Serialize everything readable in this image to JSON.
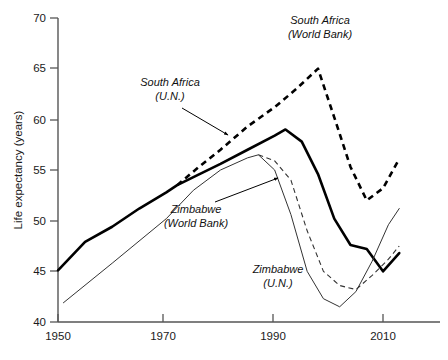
{
  "chart_data": {
    "type": "line",
    "title": "",
    "xlabel": "",
    "ylabel": "Life expectancy (years)",
    "xlim": [
      1945,
      2016
    ],
    "ylim": [
      40,
      70
    ],
    "xticks": [
      1950,
      1970,
      1990,
      2010
    ],
    "yticks": [
      40,
      45,
      50,
      55,
      60,
      65,
      70
    ],
    "xtick_labels": [
      "1950",
      "1970",
      "1990",
      "2010"
    ],
    "ytick_labels": [
      "40",
      "45",
      "50",
      "55",
      "60",
      "65",
      "70"
    ],
    "grid": false,
    "legend": "inline-annotations",
    "series": [
      {
        "name": "South Africa (U.N.)",
        "label_line1": "South Africa",
        "label_line2": "(U.N.)",
        "style": "solid-thick",
        "color": "#000000",
        "points": [
          [
            1950,
            45.1
          ],
          [
            1955,
            47.9
          ],
          [
            1960,
            49.4
          ],
          [
            1965,
            51.2
          ],
          [
            1970,
            52.8
          ],
          [
            1972,
            53.5
          ],
          [
            1975,
            54.3
          ],
          [
            1980,
            55.6
          ],
          [
            1985,
            57.0
          ],
          [
            1990,
            58.4
          ],
          [
            1992,
            59.0
          ],
          [
            1995,
            57.8
          ],
          [
            1998,
            54.6
          ],
          [
            2001,
            50.2
          ],
          [
            2004,
            47.6
          ],
          [
            2007,
            47.2
          ],
          [
            2010,
            45.0
          ],
          [
            2013,
            46.8
          ]
        ]
      },
      {
        "name": "South Africa (World Bank)",
        "label_line1": "South Africa",
        "label_line2": "(World Bank)",
        "style": "dashed-thick",
        "color": "#000000",
        "points": [
          [
            1972,
            53.5
          ],
          [
            1976,
            55.3
          ],
          [
            1980,
            57.0
          ],
          [
            1985,
            59.3
          ],
          [
            1990,
            61.2
          ],
          [
            1994,
            63.0
          ],
          [
            1998,
            65.0
          ],
          [
            2001,
            60.2
          ],
          [
            2004,
            55.3
          ],
          [
            2007,
            52.0
          ],
          [
            2010,
            53.2
          ],
          [
            2013,
            56.1
          ]
        ]
      },
      {
        "name": "Zimbabwe (World Bank)",
        "label_line1": "Zimbabwe",
        "label_line2": "(World Bank)",
        "style": "dashed-thin",
        "color": "#000000",
        "points": [
          [
            1987,
            56.5
          ],
          [
            1990,
            55.9
          ],
          [
            1993,
            54.0
          ],
          [
            1996,
            49.0
          ],
          [
            1999,
            45.0
          ],
          [
            2002,
            43.6
          ],
          [
            2005,
            43.2
          ],
          [
            2008,
            44.6
          ],
          [
            2011,
            46.2
          ],
          [
            2013,
            47.5
          ]
        ]
      },
      {
        "name": "Zimbabwe (U.N.)",
        "label_line1": "Zimbabwe",
        "label_line2": "(U.N.)",
        "style": "solid-thin",
        "color": "#000000",
        "points": [
          [
            1951,
            41.9
          ],
          [
            1960,
            45.8
          ],
          [
            1970,
            50.2
          ],
          [
            1975,
            53.0
          ],
          [
            1980,
            55.0
          ],
          [
            1985,
            56.2
          ],
          [
            1987,
            56.5
          ],
          [
            1990,
            55.0
          ],
          [
            1993,
            50.6
          ],
          [
            1996,
            45.0
          ],
          [
            1999,
            42.3
          ],
          [
            2002,
            41.5
          ],
          [
            2005,
            43.0
          ],
          [
            2008,
            46.0
          ],
          [
            2011,
            49.6
          ],
          [
            2013,
            51.2
          ]
        ]
      }
    ],
    "annotations": [
      {
        "name": "south-africa-un",
        "text_line1": "South Africa",
        "text_line2": "(U.N.)",
        "text_x": 170,
        "text_y": 86,
        "leader_from": [
          182,
          108
        ],
        "leader_to": [
          228,
          135
        ]
      },
      {
        "name": "south-africa-world-bank",
        "text_line1": "South Africa",
        "text_line2": "(World Bank)",
        "text_x": 275,
        "text_y": 24,
        "leader_from": null,
        "leader_to": null
      },
      {
        "name": "zimbabwe-world-bank",
        "text_line1": "Zimbabwe",
        "text_line2": "(World Bank)",
        "text_x": 157,
        "text_y": 211,
        "leader_from": [
          215,
          202
        ],
        "leader_to": [
          278,
          178
        ]
      },
      {
        "name": "zimbabwe-un",
        "text_line1": "Zimbabwe",
        "text_line2": "(U.N.)",
        "text_x": 238,
        "text_y": 271,
        "leader_from": null,
        "leader_to": null
      }
    ]
  },
  "axes": {
    "y_title": "Life expectancy (years)"
  }
}
